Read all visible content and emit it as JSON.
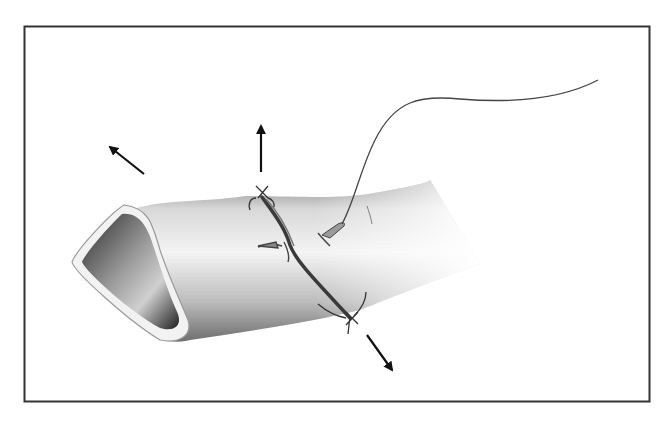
{
  "figure": {
    "border_color": "#333333",
    "background": "#ffffff",
    "arrows": [
      {
        "name": "traction-arrow-upper-left",
        "direction": "up-left"
      },
      {
        "name": "traction-arrow-up",
        "direction": "up"
      },
      {
        "name": "traction-arrow-down-right",
        "direction": "down-right"
      }
    ],
    "elements": [
      "vessel",
      "incision",
      "running-suture",
      "needle",
      "knots",
      "suture-thread"
    ]
  }
}
